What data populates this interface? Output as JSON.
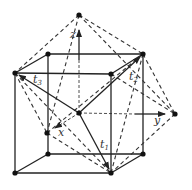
{
  "diagram": {
    "colors": {
      "line": "#222222",
      "dash": "#333333",
      "point": "#111111",
      "background": "#ffffff"
    },
    "labels": {
      "z": "z",
      "y": "y",
      "x": "x",
      "t1": "t",
      "t1_sub": "1",
      "t2": "t",
      "t2_sub": "2",
      "t3": "t",
      "t3_sub": "3"
    },
    "points": {
      "apex_top": [
        79,
        15
      ],
      "cube_back_top_left": [
        48,
        54
      ],
      "cube_back_top_right": [
        143,
        54
      ],
      "cube_front_top_left": [
        15,
        73
      ],
      "cube_front_top_right": [
        111,
        74
      ],
      "center": [
        79,
        113
      ],
      "vertex_right": [
        175,
        114
      ],
      "x_tip": [
        47,
        133
      ],
      "cube_back_bottom_left": [
        48,
        154
      ],
      "cube_back_bottom_right": [
        143,
        154
      ],
      "cube_front_bottom_left": [
        15,
        173
      ],
      "cube_front_bottom_right": [
        111,
        173
      ]
    }
  }
}
